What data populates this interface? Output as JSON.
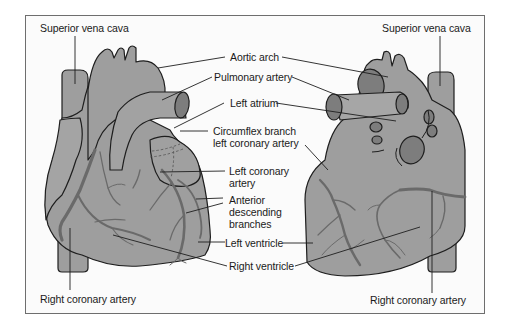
{
  "figure": {
    "colors": {
      "heart_fill": "#9e9e9e",
      "outline": "#1e1e1e",
      "vessel": "#6f6f6f",
      "vessel_lumen": "#7d7d7d",
      "frame_border": "#6e6e6e",
      "background": "#fbfbfb"
    },
    "views": [
      {
        "name": "anterior-view",
        "position": "left"
      },
      {
        "name": "posterior-view",
        "position": "right"
      }
    ]
  },
  "labels": {
    "svc_left": "Superior vena cava",
    "svc_right": "Superior vena cava",
    "aortic_arch": "Aortic arch",
    "pulmonary_artery": "Pulmonary artery",
    "left_atrium": "Left atrium",
    "circumflex": "Circumflex branch\nleft coronary artery",
    "left_coronary": "Left coronary\nartery",
    "anterior_descending": "Anterior\ndescending\nbranches",
    "left_ventricle": "Left ventricle",
    "right_ventricle": "Right ventricle",
    "rca_left": "Right coronary artery",
    "rca_right": "Right coronary artery"
  }
}
